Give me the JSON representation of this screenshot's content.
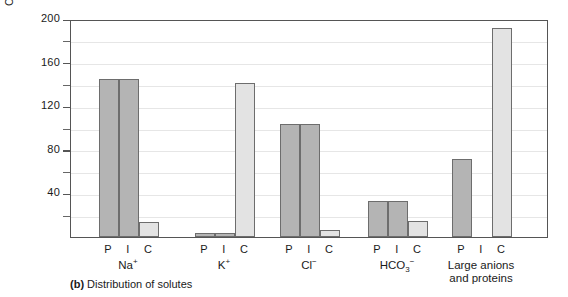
{
  "caption": {
    "marker": "(b)",
    "text": "Distribution of solutes"
  },
  "chart_data": {
    "type": "bar",
    "title": "",
    "subtitle": "",
    "xlabel": "",
    "ylabel": "Concentration (mmol / L)",
    "ylim": [
      0,
      200
    ],
    "ytick_major": [
      0,
      40,
      80,
      120,
      160,
      200
    ],
    "ytick_major_labels": [
      "",
      "40",
      "80",
      "120",
      "160",
      "200"
    ],
    "ytick_minor": [
      20,
      60,
      100,
      140,
      180
    ],
    "grid": true,
    "grid_axis": "y",
    "legend": "none",
    "series": [
      {
        "name": "P",
        "label": "P",
        "color": "#b4b4b4",
        "values": [
          145,
          4,
          104,
          33,
          72
        ]
      },
      {
        "name": "I",
        "label": "I",
        "color": "#b4b4b4",
        "values": [
          145,
          4,
          104,
          33,
          0
        ]
      },
      {
        "name": "C",
        "label": "C",
        "color": "#e3e3e3",
        "values": [
          14,
          141,
          6,
          15,
          192
        ]
      }
    ],
    "categories": [
      "Na+",
      "K+",
      "Cl-",
      "HCO3-",
      "Large anions and proteins"
    ],
    "category_labels": [
      {
        "base": "Na",
        "sup": "+",
        "sub": "",
        "line2": ""
      },
      {
        "base": "K",
        "sup": "+",
        "sub": "",
        "line2": ""
      },
      {
        "base": "Cl",
        "sup": "−",
        "sub": "",
        "line2": ""
      },
      {
        "base": "HCO",
        "sup": "−",
        "sub": "3",
        "line2": ""
      },
      {
        "base": "Large anions",
        "sup": "",
        "sub": "",
        "line2": "and proteins"
      }
    ],
    "bar_labels": [
      "P",
      "I",
      "C"
    ]
  },
  "axis": {
    "ticks": [
      {
        "value": 200,
        "label": "200",
        "major": true
      },
      {
        "value": 180,
        "label": "",
        "major": false
      },
      {
        "value": 160,
        "label": "160",
        "major": true
      },
      {
        "value": 140,
        "label": "",
        "major": false
      },
      {
        "value": 120,
        "label": "120",
        "major": true
      },
      {
        "value": 100,
        "label": "",
        "major": false
      },
      {
        "value": 80,
        "label": "80",
        "major": true
      },
      {
        "value": 60,
        "label": "",
        "major": false
      },
      {
        "value": 40,
        "label": "40",
        "major": true
      },
      {
        "value": 20,
        "label": "",
        "major": false
      }
    ]
  }
}
